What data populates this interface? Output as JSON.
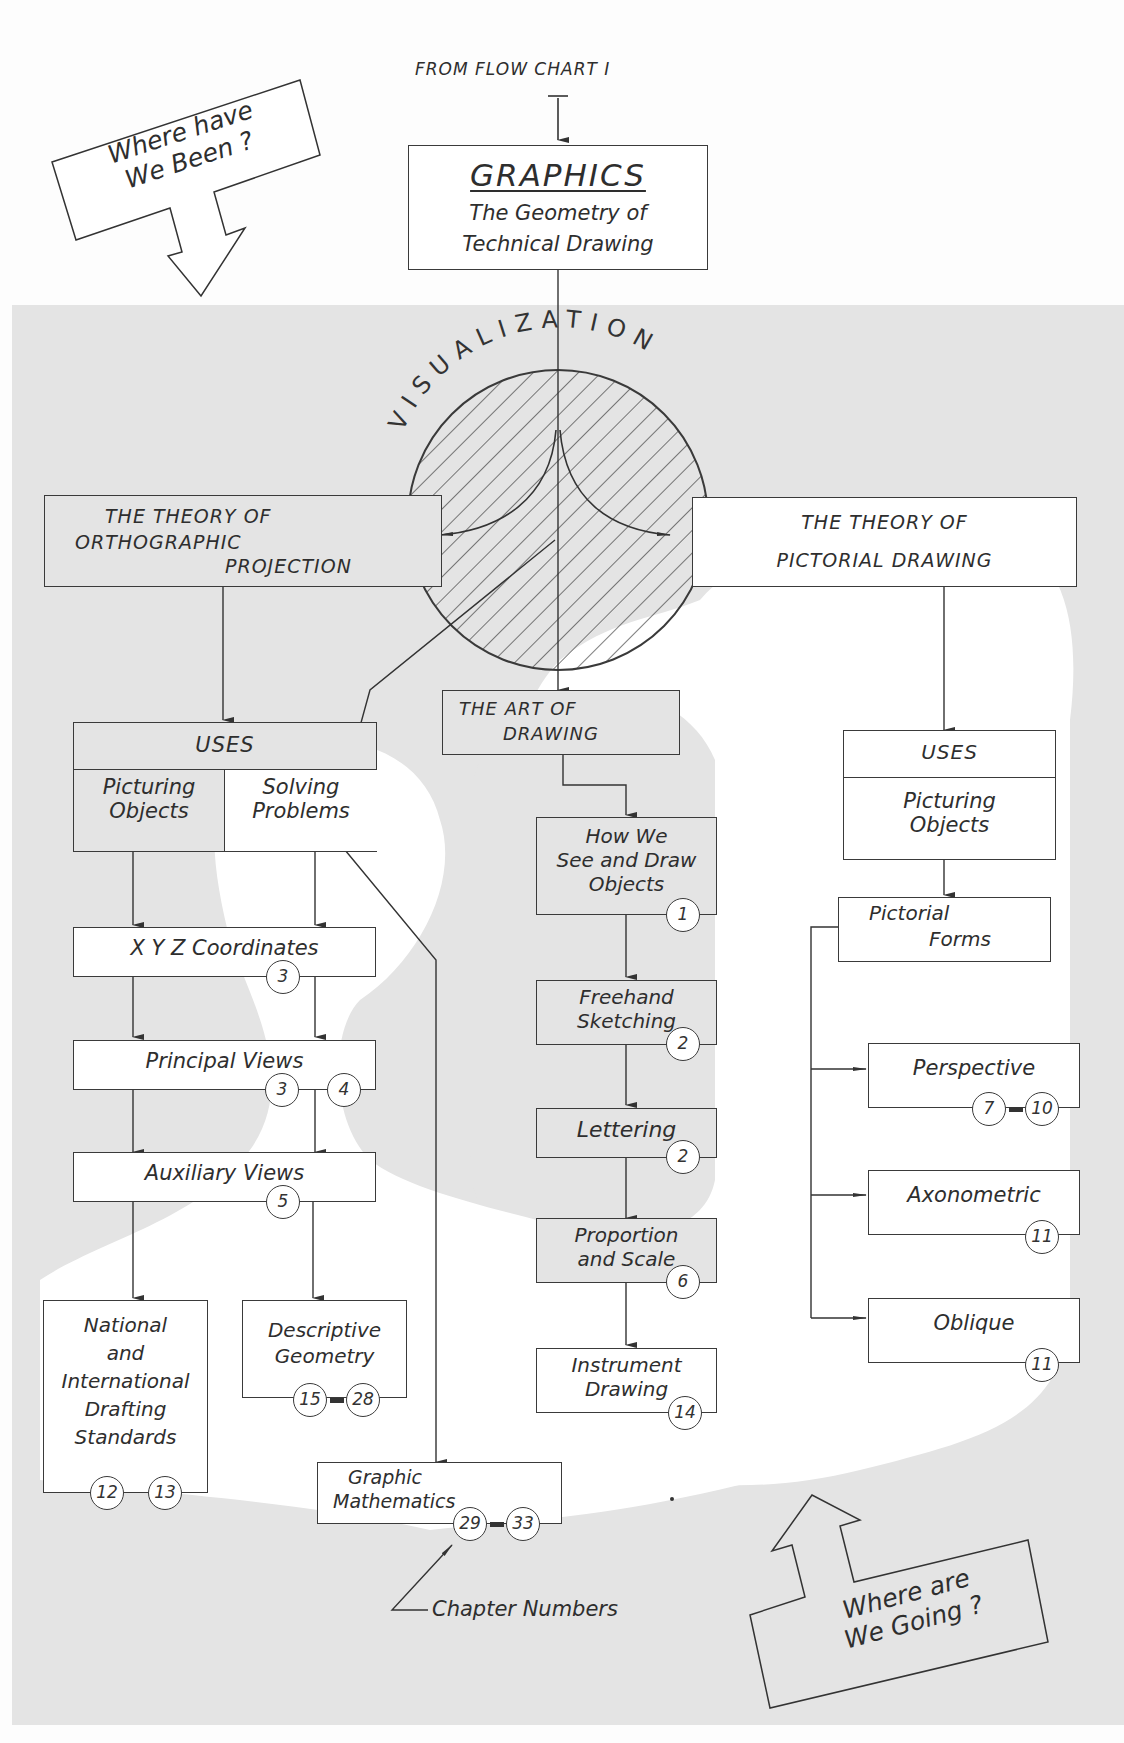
{
  "header": {
    "from_label": "FROM FLOW CHART I"
  },
  "callouts": {
    "where_been": {
      "line1": "Where have",
      "line2": "We Been ?"
    },
    "where_going": {
      "line1": "Where are",
      "line2": "We Going ?"
    }
  },
  "graphics": {
    "title": "GRAPHICS",
    "line1": "The Geometry of",
    "line2": "Technical Drawing"
  },
  "visualization": {
    "label": "VISUALIZATION"
  },
  "orthographic": {
    "theory": {
      "line1": "THE THEORY  OF",
      "line2": "ORTHOGRAPHIC",
      "line3": "PROJECTION"
    },
    "uses": {
      "header": "USES",
      "left_line1": "Picturing",
      "left_line2": "Objects",
      "right_line1": "Solving",
      "right_line2": "Problems"
    },
    "xyz": {
      "label": "X Y Z  Coordinates",
      "chapters": [
        "3"
      ]
    },
    "principal": {
      "label": "Principal  Views",
      "chapters": [
        "3",
        "4"
      ]
    },
    "auxiliary": {
      "label": "Auxiliary  Views",
      "chapters": [
        "5"
      ]
    },
    "standards": {
      "line1": "National",
      "line2": "and",
      "line3": "International",
      "line4": "Drafting",
      "line5": "Standards",
      "chapters": [
        "12",
        "13"
      ]
    },
    "descriptive": {
      "line1": "Descriptive",
      "line2": "Geometry",
      "chapters": [
        "15",
        "28"
      ]
    },
    "math": {
      "line1": "Graphic",
      "line2": "Mathematics",
      "chapters": [
        "29",
        "33"
      ]
    }
  },
  "art": {
    "title": {
      "line1": "THE ART OF",
      "line2": "DRAWING"
    },
    "see_draw": {
      "line1": "How We",
      "line2": "See and Draw",
      "line3": "Objects",
      "chapters": [
        "1"
      ]
    },
    "freehand": {
      "line1": "Freehand",
      "line2": "Sketching",
      "chapters": [
        "2"
      ]
    },
    "lettering": {
      "label": "Lettering",
      "chapters": [
        "2"
      ]
    },
    "proportion": {
      "line1": "Proportion",
      "line2": "and Scale",
      "chapters": [
        "6"
      ]
    },
    "instrument": {
      "line1": "Instrument",
      "line2": "Drawing",
      "chapters": [
        "14"
      ]
    }
  },
  "pictorial": {
    "theory": {
      "line1": "THE THEORY  OF",
      "line2": "PICTORIAL  DRAWING"
    },
    "uses": {
      "header": "USES",
      "line1": "Picturing",
      "line2": "Objects"
    },
    "forms": {
      "line1": "Pictorial",
      "line2": "Forms"
    },
    "perspective": {
      "label": "Perspective",
      "chapters": [
        "7",
        "10"
      ]
    },
    "axonometric": {
      "label": "Axonometric",
      "chapters": [
        "11"
      ]
    },
    "oblique": {
      "label": "Oblique",
      "chapters": [
        "11"
      ]
    }
  },
  "legend": {
    "chapter_numbers": "Chapter Numbers"
  },
  "colors": {
    "shaded_region": "#e6e6e6",
    "white_region": "#ffffff",
    "ink": "#333333"
  }
}
